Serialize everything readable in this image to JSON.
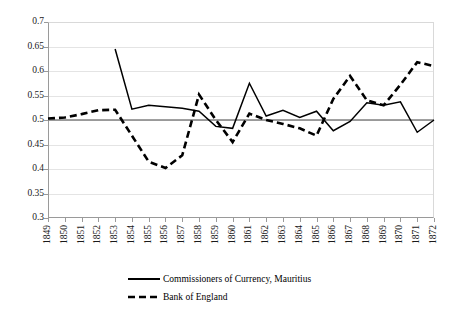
{
  "chart_data": {
    "type": "line",
    "title": "",
    "subtitle": "",
    "xlabel": "",
    "ylabel": "",
    "grid": true,
    "legend_position": "bottom",
    "xlim": [
      1849,
      1872
    ],
    "ylim": [
      0.3,
      0.7
    ],
    "ytick_labels": [
      "0.7",
      "0.65",
      "0.6",
      "0.55",
      "0.5",
      "0.45",
      "0.4",
      "0.35",
      "0.3"
    ],
    "ytick_values": [
      0.7,
      0.65,
      0.6,
      0.55,
      0.5,
      0.45,
      0.4,
      0.35,
      0.3
    ],
    "categories": [
      "1849",
      "1850",
      "1851",
      "1852",
      "1853",
      "1854",
      "1855",
      "1856",
      "1857",
      "1858",
      "1859",
      "1860",
      "1861",
      "1862",
      "1863",
      "1864",
      "1865",
      "1866",
      "1867",
      "1868",
      "1869",
      "1870",
      "1871",
      "1872"
    ],
    "x": [
      1849,
      1850,
      1851,
      1852,
      1853,
      1854,
      1855,
      1856,
      1857,
      1858,
      1859,
      1860,
      1861,
      1862,
      1863,
      1864,
      1865,
      1866,
      1867,
      1868,
      1869,
      1870,
      1871,
      1872
    ],
    "reference_line": {
      "value": 0.5,
      "color": "#808080"
    },
    "series": [
      {
        "name": "Commissioners of Currency, Mauritius",
        "style": "solid",
        "color": "#000000",
        "values": [
          null,
          null,
          null,
          null,
          0.645,
          0.522,
          0.53,
          0.527,
          0.524,
          0.518,
          0.487,
          0.483,
          0.575,
          0.508,
          0.52,
          0.505,
          0.518,
          0.478,
          0.497,
          0.535,
          0.53,
          0.537,
          0.475,
          0.5
        ]
      },
      {
        "name": "Bank of England",
        "style": "dashed",
        "color": "#000000",
        "values": [
          0.503,
          0.505,
          0.512,
          0.52,
          0.521,
          0.468,
          0.415,
          0.402,
          0.428,
          0.552,
          0.5,
          0.455,
          0.513,
          0.5,
          0.492,
          0.483,
          0.468,
          0.543,
          0.59,
          0.54,
          0.53,
          0.572,
          0.618,
          0.61
        ]
      }
    ]
  },
  "legend": {
    "entries": [
      {
        "label": "Commissioners of Currency, Mauritius",
        "style": "solid"
      },
      {
        "label": "Bank of England",
        "style": "dashed"
      }
    ]
  }
}
